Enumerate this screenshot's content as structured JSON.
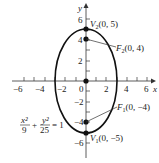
{
  "diagram": {
    "type": "ellipse",
    "equation": {
      "x_num": "x²",
      "x_den": "9",
      "plus": "+",
      "y_num": "y²",
      "y_den": "25",
      "rhs": "= 1"
    },
    "axes": {
      "x_label": "x",
      "y_label": "y",
      "x_ticks": [
        "−6",
        "−4",
        "−2",
        "0",
        "2",
        "4",
        "6"
      ],
      "y_ticks": [
        "6",
        "4",
        "2",
        "−2",
        "−4",
        "−6"
      ]
    },
    "points": {
      "v2": {
        "name": "V",
        "sub": "2",
        "coords": "(0, 5)"
      },
      "f2": {
        "name": "F",
        "sub": "2",
        "coords": "(0, 4)"
      },
      "f1": {
        "name": "F",
        "sub": "1",
        "coords": "(0, −4)"
      },
      "v1": {
        "name": "V",
        "sub": "1",
        "coords": "(0, −5)"
      }
    },
    "ellipse": {
      "a": 3,
      "b": 5,
      "center": [
        0,
        0
      ]
    },
    "colors": {
      "stroke": "#111111",
      "background": "#ffffff"
    }
  }
}
